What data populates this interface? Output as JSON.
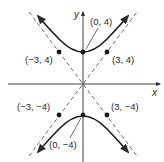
{
  "figure": {
    "equation_implied": "y^2/16 - x^2/9 = 1",
    "axes": {
      "x_label": "x",
      "y_label": "y"
    },
    "points": [
      {
        "id": "vertex-top",
        "label": "(0, 4)",
        "x": 0,
        "y": 4
      },
      {
        "id": "asym-pt-upper-left",
        "label": "(−3, 4)",
        "x": -3,
        "y": 4
      },
      {
        "id": "asym-pt-upper-right",
        "label": "(3, 4)",
        "x": 3,
        "y": 4
      },
      {
        "id": "asym-pt-lower-left",
        "label": "(−3, −4)",
        "x": -3,
        "y": -4
      },
      {
        "id": "asym-pt-lower-right",
        "label": "(3, −4)",
        "x": 3,
        "y": -4
      },
      {
        "id": "vertex-bottom",
        "label": "(0, −4)",
        "x": 0,
        "y": -4
      }
    ],
    "asymptotes": [
      "y = 4x/3",
      "y = -4x/3"
    ],
    "colors": {
      "ink": "#2a2a2a",
      "dashed": "#555555"
    }
  }
}
